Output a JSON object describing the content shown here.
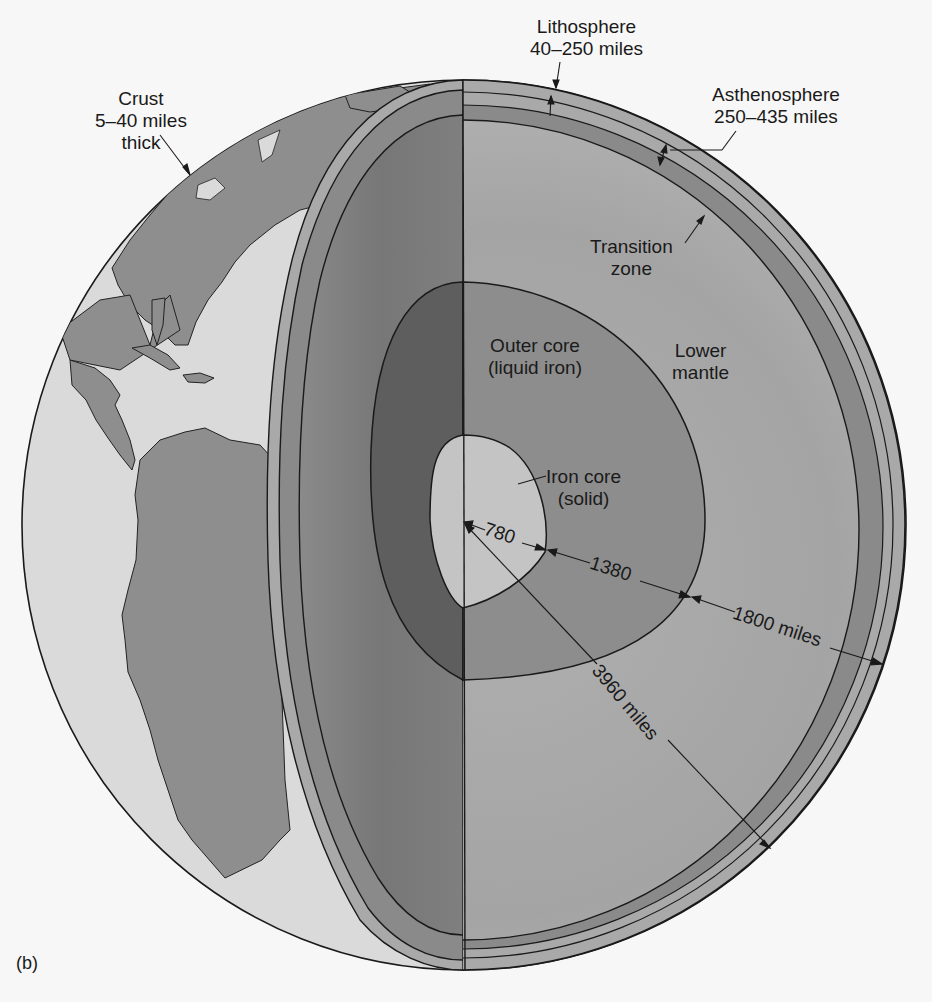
{
  "figure": {
    "panel_label": "(b)"
  },
  "colors": {
    "background": "#f7f7f7",
    "ocean": "#dadada",
    "land": "#8e8e8e",
    "crust_band": "#a9a9a9",
    "asthenosphere_band": "#8a8a8a",
    "mantle_cut_left": "#7d7d7d",
    "mantle_right": "#a8a8a8",
    "outer_core_left": "#5e5e5e",
    "outer_core_right": "#8d8d8d",
    "inner_core": "#c4c4c4",
    "line": "#1a1a1a"
  },
  "labels": {
    "crust": {
      "line1": "Crust",
      "line2": "5–40 miles",
      "line3": "thick"
    },
    "lithosphere": {
      "line1": "Lithosphere",
      "line2": "40–250 miles"
    },
    "asthenosphere": {
      "line1": "Asthenosphere",
      "line2": "250–435 miles"
    },
    "transition_zone": {
      "line1": "Transition",
      "line2": "zone"
    },
    "outer_core": {
      "line1": "Outer core",
      "line2": "(liquid iron)"
    },
    "lower_mantle": {
      "line1": "Lower",
      "line2": "mantle"
    },
    "iron_core": {
      "line1": "Iron core",
      "line2": "(solid)"
    }
  },
  "measurements": {
    "inner_core_radius": "780",
    "outer_core_thickness": "1380",
    "mantle_thickness": "1800 miles",
    "earth_radius": "3960 miles"
  }
}
